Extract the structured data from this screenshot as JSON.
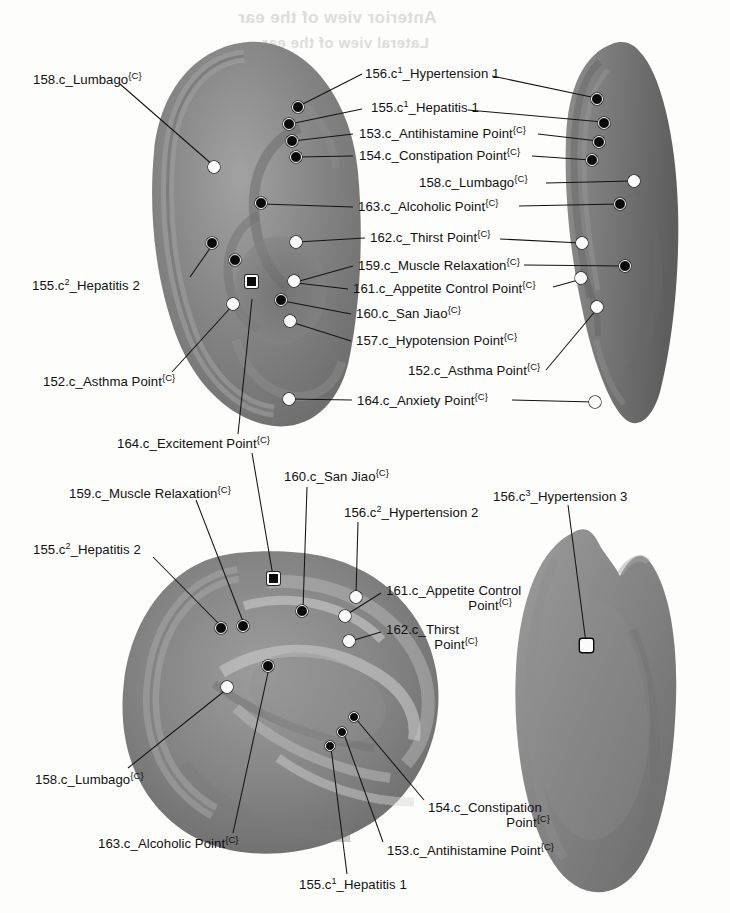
{
  "figure": {
    "background_color": "#fdfdfc",
    "ear_color": "#7d7d7d",
    "marker_fill_color": "#0a0a0a",
    "marker_open_color": "#fbfbfb",
    "leader_line_color": "#14140f",
    "superscript_tag": "{C}"
  },
  "bleed_through": [
    {
      "text": "Anterior view of the ear",
      "x": 238,
      "y": 8
    },
    {
      "text": "Lateral view of the ear",
      "x": 262,
      "y": 34
    }
  ],
  "views": [
    {
      "id": "top-left",
      "name": "lateral-left-ear-view"
    },
    {
      "id": "top-right",
      "name": "oblique-right-ear-view"
    },
    {
      "id": "bottom-left",
      "name": "close-up-concha-view"
    },
    {
      "id": "bottom-right",
      "name": "posterior-ear-view"
    }
  ],
  "labels": [
    {
      "id": "l01",
      "code": "158.c",
      "name": "Lumbago",
      "text": "158.c_Lumbago",
      "tag": "{C}",
      "sup": "",
      "view": "top-left",
      "x": 33,
      "y": 72,
      "align": "left"
    },
    {
      "id": "l02",
      "code": "156.c",
      "name": "Hypertension 1",
      "text": "156.c_Hypertension 1",
      "tag": "",
      "sup": "1",
      "view": "top-left",
      "x": 365,
      "y": 72,
      "align": "left"
    },
    {
      "id": "l03",
      "code": "155.c",
      "name": "Hepatitis 1",
      "text": "155.c_Hepatitis 1",
      "tag": "",
      "sup": "1",
      "view": "top-left",
      "x": 365,
      "y": 105,
      "align": "left"
    },
    {
      "id": "l04",
      "code": "153.c",
      "name": "Antihistamine Point",
      "text": "153.c_Antihistamine Point",
      "tag": "{C}",
      "sup": "",
      "view": "top-left",
      "x": 360,
      "y": 130,
      "align": "left"
    },
    {
      "id": "l05",
      "code": "154.c",
      "name": "Constipation Point",
      "text": "154.c_Constipation Point",
      "tag": "{C}",
      "sup": "",
      "view": "top-left",
      "x": 360,
      "y": 152,
      "align": "left"
    },
    {
      "id": "l06",
      "code": "158.c",
      "name": "Lumbago",
      "text": "158.c_Lumbago",
      "tag": "{C}",
      "sup": "",
      "view": "top-right",
      "x": 419,
      "y": 178,
      "align": "left"
    },
    {
      "id": "l07",
      "code": "163.c",
      "name": "Alcoholic Point",
      "text": "163.c_Alcoholic Point",
      "tag": "{C}",
      "sup": "",
      "view": "top-left",
      "x": 358,
      "y": 202,
      "align": "left"
    },
    {
      "id": "l08",
      "code": "162.c",
      "name": "Thirst Point",
      "text": "162.c_Thirst Point",
      "tag": "{C}",
      "sup": "",
      "view": "top-left",
      "x": 370,
      "y": 234,
      "align": "left"
    },
    {
      "id": "l09",
      "code": "159.c",
      "name": "Muscle Relaxation",
      "text": "159.c_Muscle Relaxation",
      "tag": "{C}",
      "sup": "",
      "view": "top-left",
      "x": 358,
      "y": 262,
      "align": "left"
    },
    {
      "id": "l10",
      "code": "155.c",
      "name": "Hepatitis 2",
      "text": "155.c_Hepatitis 2",
      "tag": "",
      "sup": "2",
      "view": "top-left",
      "x": 32,
      "y": 280,
      "align": "left"
    },
    {
      "id": "l11",
      "code": "161.c",
      "name": "Appetite Control Point",
      "text": "161.c_Appetite Control Point",
      "tag": "{C}",
      "sup": "",
      "view": "top-left",
      "x": 353,
      "y": 285,
      "align": "left"
    },
    {
      "id": "l12",
      "code": "160.c",
      "name": "San Jiao",
      "text": "160.c_San Jiao",
      "tag": "{C}",
      "sup": "",
      "view": "top-left",
      "x": 356,
      "y": 310,
      "align": "left"
    },
    {
      "id": "l13",
      "code": "157.c",
      "name": "Hypotension Point",
      "text": "157.c_Hypotension Point",
      "tag": "{C}",
      "sup": "",
      "view": "top-left",
      "x": 356,
      "y": 337,
      "align": "left"
    },
    {
      "id": "l14",
      "code": "152.c",
      "name": "Asthma Point",
      "text": "152.c_Asthma Point",
      "tag": "{C}",
      "sup": "",
      "view": "top-right",
      "x": 408,
      "y": 366,
      "align": "left"
    },
    {
      "id": "l15",
      "code": "152.c",
      "name": "Asthma Point",
      "text": "152.c_Asthma Point",
      "tag": "{C}",
      "sup": "",
      "view": "top-left",
      "x": 43,
      "y": 377,
      "align": "left"
    },
    {
      "id": "l16",
      "code": "164.c",
      "name": "Anxiety Point",
      "text": "164.c_Anxiety Point",
      "tag": "{C}",
      "sup": "",
      "view": "top-left",
      "x": 357,
      "y": 396,
      "align": "left"
    },
    {
      "id": "l17",
      "code": "164.c",
      "name": "Excitement Point",
      "text": "164.c_Excitement Point",
      "tag": "{C}",
      "sup": "",
      "view": "top-left",
      "x": 117,
      "y": 439,
      "align": "left"
    },
    {
      "id": "l18",
      "code": "160.c",
      "name": "San Jiao",
      "text": "160.c_San Jiao",
      "tag": "{C}",
      "sup": "",
      "view": "bottom-left",
      "x": 284,
      "y": 472,
      "align": "left"
    },
    {
      "id": "l19",
      "code": "156.c",
      "name": "Hypertension 3",
      "text": "156.c_Hypertension 3",
      "tag": "",
      "sup": "3",
      "view": "bottom-right",
      "x": 493,
      "y": 492,
      "align": "left"
    },
    {
      "id": "l20",
      "code": "159.c",
      "name": "Muscle Relaxation",
      "text": "159.c_Muscle Relaxation",
      "tag": "{C}",
      "sup": "",
      "view": "bottom-left",
      "x": 69,
      "y": 488,
      "align": "left"
    },
    {
      "id": "l21",
      "code": "156.c",
      "name": "Hypertension 2",
      "text": "156.c_Hypertension 2",
      "tag": "",
      "sup": "2",
      "view": "bottom-left",
      "x": 344,
      "y": 508,
      "align": "left"
    },
    {
      "id": "l22",
      "code": "155.c",
      "name": "Hepatitis 2",
      "text": "155.c_Hepatitis 2",
      "tag": "",
      "sup": "2",
      "view": "bottom-left",
      "x": 33,
      "y": 545,
      "align": "left"
    },
    {
      "id": "l23",
      "code": "161.c",
      "name": "Appetite Control Point",
      "text": "161.c_Appetite Control",
      "tag": "{C}",
      "sup": "",
      "view": "bottom-left",
      "x": 386,
      "y": 588,
      "align": "left",
      "line2": "Point"
    },
    {
      "id": "l24",
      "code": "162.c",
      "name": "Thirst Point",
      "text": "162.c_Thirst",
      "tag": "{C}",
      "sup": "",
      "view": "bottom-left",
      "x": 386,
      "y": 627,
      "align": "left",
      "line2": "Point"
    },
    {
      "id": "l25",
      "code": "158.c",
      "name": "Lumbago",
      "text": "158.c_Lumbago",
      "tag": "{C}",
      "sup": "",
      "view": "bottom-left",
      "x": 35,
      "y": 775,
      "align": "left"
    },
    {
      "id": "l26",
      "code": "154.c",
      "name": "Constipation Point",
      "text": "154.c_Constipation",
      "tag": "{C}",
      "sup": "",
      "view": "bottom-left",
      "x": 428,
      "y": 805,
      "align": "left",
      "line2": "Point"
    },
    {
      "id": "l27",
      "code": "163.c",
      "name": "Alcoholic Point",
      "text": "163.c_Alcoholic Point",
      "tag": "{C}",
      "sup": "",
      "view": "bottom-left",
      "x": 98,
      "y": 840,
      "align": "left"
    },
    {
      "id": "l28",
      "code": "153.c",
      "name": "Antihistamine Point",
      "text": "153.c_Antihistamine Point",
      "tag": "{C}",
      "sup": "",
      "view": "bottom-left",
      "x": 387,
      "y": 847,
      "align": "left"
    },
    {
      "id": "l29",
      "code": "155.c",
      "name": "Hepatitis 1",
      "text": "155.c_Hepatitis 1",
      "tag": "",
      "sup": "1",
      "view": "bottom-left",
      "x": 299,
      "y": 881,
      "align": "left"
    }
  ],
  "points": [
    {
      "id": "p01",
      "ref": "158.c_Lumbago",
      "view": "top-left",
      "style": "open",
      "x": 214,
      "y": 167
    },
    {
      "id": "p02",
      "ref": "156.c1_Hypertension 1",
      "view": "top-left",
      "style": "filled",
      "x": 298,
      "y": 107
    },
    {
      "id": "p03",
      "ref": "155.c1_Hepatitis 1",
      "view": "top-left",
      "style": "filled",
      "x": 289,
      "y": 124
    },
    {
      "id": "p04",
      "ref": "153.c_Antihistamine Point",
      "view": "top-left",
      "style": "filled",
      "x": 292,
      "y": 141
    },
    {
      "id": "p05",
      "ref": "154.c_Constipation Point",
      "view": "top-left",
      "style": "filled",
      "x": 296,
      "y": 157
    },
    {
      "id": "p06",
      "ref": "163.c_Alcoholic Point",
      "view": "top-left",
      "style": "filled",
      "x": 261,
      "y": 203
    },
    {
      "id": "p07",
      "ref": "162.c_Thirst Point",
      "view": "top-left",
      "style": "open",
      "x": 296,
      "y": 242
    },
    {
      "id": "p08",
      "ref": "155.c2_Hepatitis 2",
      "view": "top-left",
      "style": "filled",
      "x": 212,
      "y": 243
    },
    {
      "id": "p09",
      "ref": "159.c_Muscle Relaxation",
      "view": "top-left",
      "style": "filled",
      "x": 235,
      "y": 260
    },
    {
      "id": "p10",
      "ref": "164.c_Excitement Point",
      "view": "top-left",
      "style": "sq-filled",
      "x": 251,
      "y": 281
    },
    {
      "id": "p11",
      "ref": "161.c_Appetite Control",
      "view": "top-left",
      "style": "open",
      "x": 294,
      "y": 281
    },
    {
      "id": "p12",
      "ref": "160.c_San Jiao",
      "view": "top-left",
      "style": "filled",
      "x": 281,
      "y": 300
    },
    {
      "id": "p13",
      "ref": "152.c_Asthma Point",
      "view": "top-left",
      "style": "open",
      "x": 233,
      "y": 304
    },
    {
      "id": "p14",
      "ref": "157.c_Hypotension Point",
      "view": "top-left",
      "style": "open",
      "x": 290,
      "y": 321
    },
    {
      "id": "p15",
      "ref": "164.c_Anxiety Point",
      "view": "top-left",
      "style": "open",
      "x": 289,
      "y": 399
    },
    {
      "id": "p16",
      "ref": "156.c1_Hypertension 1",
      "view": "top-right",
      "style": "filled",
      "x": 597,
      "y": 99
    },
    {
      "id": "p17",
      "ref": "155.c1_Hepatitis 1",
      "view": "top-right",
      "style": "filled",
      "x": 604,
      "y": 123
    },
    {
      "id": "p18",
      "ref": "153.c_Antihistamine Point",
      "view": "top-right",
      "style": "filled",
      "x": 599,
      "y": 142
    },
    {
      "id": "p19",
      "ref": "154.c_Constipation Point",
      "view": "top-right",
      "style": "filled",
      "x": 592,
      "y": 160
    },
    {
      "id": "p20",
      "ref": "158.c_Lumbago",
      "view": "top-right",
      "style": "open",
      "x": 634,
      "y": 181
    },
    {
      "id": "p21",
      "ref": "163.c_Alcoholic Point",
      "view": "top-right",
      "style": "filled",
      "x": 620,
      "y": 204
    },
    {
      "id": "p22",
      "ref": "162.c_Thirst Point",
      "view": "top-right",
      "style": "open",
      "x": 582,
      "y": 243
    },
    {
      "id": "p23",
      "ref": "159.c_Muscle Relaxation",
      "view": "top-right",
      "style": "filled",
      "x": 625,
      "y": 266
    },
    {
      "id": "p24",
      "ref": "161.c_Appetite Control",
      "view": "top-right",
      "style": "open",
      "x": 581,
      "y": 278
    },
    {
      "id": "p25",
      "ref": "152.c_Asthma Point",
      "view": "top-right",
      "style": "open",
      "x": 597,
      "y": 307
    },
    {
      "id": "p26",
      "ref": "164.c_Anxiety Point",
      "view": "top-right",
      "style": "open",
      "x": 595,
      "y": 402
    },
    {
      "id": "p27",
      "ref": "164.c_Excitement Point",
      "view": "bottom-left",
      "style": "sq-filled",
      "x": 273,
      "y": 578
    },
    {
      "id": "p28",
      "ref": "160.c_San Jiao",
      "view": "bottom-left",
      "style": "filled",
      "x": 302,
      "y": 611
    },
    {
      "id": "p29",
      "ref": "156.c2_Hypertension 2",
      "view": "bottom-left",
      "style": "open",
      "x": 356,
      "y": 597
    },
    {
      "id": "p30",
      "ref": "161.c_Appetite Control",
      "view": "bottom-left",
      "style": "open",
      "x": 345,
      "y": 616
    },
    {
      "id": "p31",
      "ref": "162.c_Thirst Point",
      "view": "bottom-left",
      "style": "open",
      "x": 349,
      "y": 641
    },
    {
      "id": "p32",
      "ref": "155.c2_Hepatitis 2",
      "view": "bottom-left",
      "style": "filled",
      "x": 221,
      "y": 628
    },
    {
      "id": "p33",
      "ref": "159.c_Muscle Relaxation",
      "view": "bottom-left",
      "style": "filled",
      "x": 243,
      "y": 626
    },
    {
      "id": "p34",
      "ref": "163.c_Alcoholic Point",
      "view": "bottom-left",
      "style": "filled",
      "x": 268,
      "y": 666
    },
    {
      "id": "p35",
      "ref": "158.c_Lumbago",
      "view": "bottom-left",
      "style": "open",
      "x": 227,
      "y": 687
    },
    {
      "id": "p36",
      "ref": "154.c_Constipation Point",
      "view": "bottom-left",
      "style": "filled",
      "x": 354,
      "y": 717
    },
    {
      "id": "p37",
      "ref": "153.c_Antihistamine Point",
      "view": "bottom-left",
      "style": "filled",
      "x": 342,
      "y": 732
    },
    {
      "id": "p38",
      "ref": "155.c1_Hepatitis 1",
      "view": "bottom-left",
      "style": "filled",
      "x": 330,
      "y": 746
    },
    {
      "id": "p39",
      "ref": "156.c3_Hypertension 3",
      "view": "bottom-right",
      "style": "sq-open",
      "x": 586,
      "y": 645
    }
  ],
  "leader_lines": [
    {
      "from_label": "l01",
      "x1": 120,
      "y1": 84,
      "x2": 214,
      "y2": 166
    },
    {
      "from_label": "l02",
      "x1": 362,
      "y1": 74,
      "x2": 299,
      "y2": 106
    },
    {
      "from_label": "l02",
      "x1": 492,
      "y1": 76,
      "x2": 596,
      "y2": 98
    },
    {
      "from_label": "l03",
      "x1": 362,
      "y1": 109,
      "x2": 290,
      "y2": 124
    },
    {
      "from_label": "l03",
      "x1": 468,
      "y1": 110,
      "x2": 603,
      "y2": 122
    },
    {
      "from_label": "l04",
      "x1": 353,
      "y1": 134,
      "x2": 293,
      "y2": 141
    },
    {
      "from_label": "l04",
      "x1": 538,
      "y1": 134,
      "x2": 598,
      "y2": 141
    },
    {
      "from_label": "l05",
      "x1": 353,
      "y1": 156,
      "x2": 297,
      "y2": 157
    },
    {
      "from_label": "l05",
      "x1": 532,
      "y1": 156,
      "x2": 591,
      "y2": 160
    },
    {
      "from_label": "l06",
      "x1": 546,
      "y1": 183,
      "x2": 633,
      "y2": 181
    },
    {
      "from_label": "l07",
      "x1": 353,
      "y1": 207,
      "x2": 262,
      "y2": 204
    },
    {
      "from_label": "l07",
      "x1": 519,
      "y1": 206,
      "x2": 619,
      "y2": 204
    },
    {
      "from_label": "l08",
      "x1": 365,
      "y1": 238,
      "x2": 297,
      "y2": 242
    },
    {
      "from_label": "l08",
      "x1": 500,
      "y1": 239,
      "x2": 581,
      "y2": 243
    },
    {
      "from_label": "l09",
      "x1": 353,
      "y1": 266,
      "x2": 296,
      "y2": 282
    },
    {
      "from_label": "l09",
      "x1": 524,
      "y1": 265,
      "x2": 624,
      "y2": 266
    },
    {
      "from_label": "l10",
      "x1": 190,
      "y1": 277,
      "x2": 213,
      "y2": 244
    },
    {
      "from_label": "l11",
      "x1": 348,
      "y1": 289,
      "x2": 297,
      "y2": 283
    },
    {
      "from_label": "l11",
      "x1": 553,
      "y1": 287,
      "x2": 582,
      "y2": 279
    },
    {
      "from_label": "l12",
      "x1": 351,
      "y1": 314,
      "x2": 283,
      "y2": 301
    },
    {
      "from_label": "l13",
      "x1": 351,
      "y1": 341,
      "x2": 291,
      "y2": 322
    },
    {
      "from_label": "l14",
      "x1": 546,
      "y1": 370,
      "x2": 597,
      "y2": 309
    },
    {
      "from_label": "l15",
      "x1": 172,
      "y1": 372,
      "x2": 233,
      "y2": 305
    },
    {
      "from_label": "l16",
      "x1": 352,
      "y1": 400,
      "x2": 290,
      "y2": 399
    },
    {
      "from_label": "l16",
      "x1": 512,
      "y1": 400,
      "x2": 594,
      "y2": 402
    },
    {
      "from_label": "l17",
      "x1": 238,
      "y1": 434,
      "x2": 252,
      "y2": 299
    },
    {
      "from_label": "l17",
      "x1": 252,
      "y1": 453,
      "x2": 273,
      "y2": 576
    },
    {
      "from_label": "l18",
      "x1": 307,
      "y1": 487,
      "x2": 303,
      "y2": 609
    },
    {
      "from_label": "l19",
      "x1": 568,
      "y1": 505,
      "x2": 586,
      "y2": 643
    },
    {
      "from_label": "l20",
      "x1": 196,
      "y1": 500,
      "x2": 244,
      "y2": 624
    },
    {
      "from_label": "l21",
      "x1": 358,
      "y1": 522,
      "x2": 356,
      "y2": 595
    },
    {
      "from_label": "l22",
      "x1": 153,
      "y1": 557,
      "x2": 221,
      "y2": 626
    },
    {
      "from_label": "l23",
      "x1": 381,
      "y1": 593,
      "x2": 346,
      "y2": 615
    },
    {
      "from_label": "l24",
      "x1": 381,
      "y1": 632,
      "x2": 351,
      "y2": 641
    },
    {
      "from_label": "l25",
      "x1": 128,
      "y1": 768,
      "x2": 227,
      "y2": 689
    },
    {
      "from_label": "l26",
      "x1": 424,
      "y1": 800,
      "x2": 356,
      "y2": 719
    },
    {
      "from_label": "l27",
      "x1": 233,
      "y1": 833,
      "x2": 269,
      "y2": 668
    },
    {
      "from_label": "l28",
      "x1": 383,
      "y1": 842,
      "x2": 344,
      "y2": 734
    },
    {
      "from_label": "l29",
      "x1": 347,
      "y1": 874,
      "x2": 331,
      "y2": 748
    }
  ]
}
